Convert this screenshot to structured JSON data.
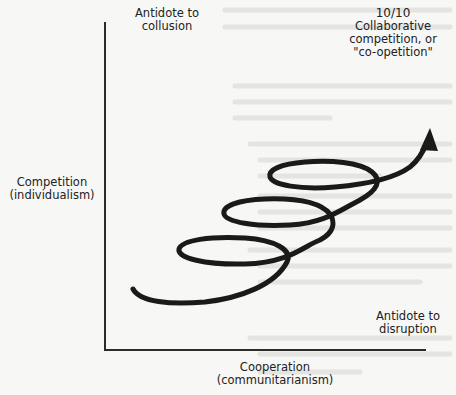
{
  "diagram": {
    "type": "spiral-quadrant",
    "axes": {
      "y_label": {
        "line1": "Competition",
        "line2": "(individualism)"
      },
      "x_label": {
        "line1": "Cooperation",
        "line2": "(communitarianism)"
      }
    },
    "corners": {
      "top_left": {
        "line1": "Antidote to",
        "line2": "collusion"
      },
      "top_right": {
        "score": "10/10",
        "line1": "Collaborative",
        "line2": "competition, or",
        "line3": "\"co-opetition\""
      },
      "bottom_right": {
        "line1": "Antidote to",
        "line2": "disruption"
      }
    },
    "spiral": {
      "loops": 3,
      "direction": "upward-right",
      "ends_with": "arrow",
      "stroke_color": "#1a1a1a"
    },
    "colors": {
      "background": "#f7f7f5",
      "axis": "#2c2c2c",
      "text": "#222222"
    }
  }
}
